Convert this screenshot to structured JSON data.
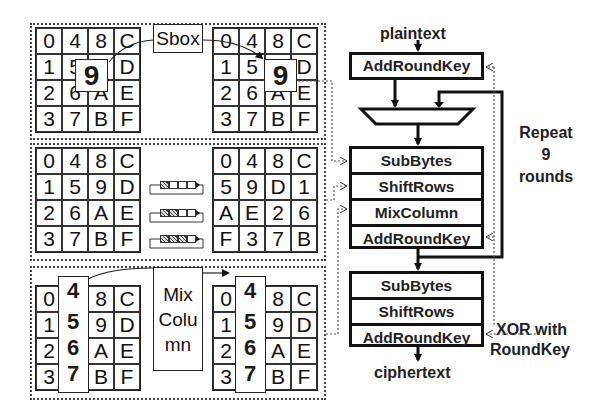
{
  "state_grid": [
    [
      "0",
      "4",
      "8",
      "C"
    ],
    [
      "1",
      "5",
      "9",
      "D"
    ],
    [
      "2",
      "6",
      "A",
      "E"
    ],
    [
      "3",
      "7",
      "B",
      "F"
    ]
  ],
  "subbytes_panel": {
    "before": [
      [
        "0",
        "4",
        "8",
        "C"
      ],
      [
        "1",
        "5",
        "9",
        "D"
      ],
      [
        "2",
        "6",
        "A",
        "E"
      ],
      [
        "3",
        "7",
        "B",
        "F"
      ]
    ],
    "after": [
      [
        "0",
        "4",
        "8",
        "C"
      ],
      [
        "1",
        "5",
        "9",
        "D"
      ],
      [
        "2",
        "6",
        "A",
        "E"
      ],
      [
        "3",
        "7",
        "B",
        "F"
      ]
    ],
    "highlight_byte": "9",
    "operation_label": "Sbox"
  },
  "shiftrows_panel": {
    "before": [
      [
        "0",
        "4",
        "8",
        "C"
      ],
      [
        "1",
        "5",
        "9",
        "D"
      ],
      [
        "2",
        "6",
        "A",
        "E"
      ],
      [
        "3",
        "7",
        "B",
        "F"
      ]
    ],
    "after": [
      [
        "0",
        "4",
        "8",
        "C"
      ],
      [
        "5",
        "9",
        "D",
        "1"
      ],
      [
        "A",
        "E",
        "2",
        "6"
      ],
      [
        "F",
        "3",
        "7",
        "B"
      ]
    ],
    "shift_amounts": [
      1,
      2,
      3
    ]
  },
  "mixcolumn_panel": {
    "before": [
      [
        "0",
        "4",
        "8",
        "C"
      ],
      [
        "1",
        "5",
        "9",
        "D"
      ],
      [
        "2",
        "6",
        "A",
        "E"
      ],
      [
        "3",
        "7",
        "B",
        "F"
      ]
    ],
    "after": [
      [
        "0",
        "4",
        "8",
        "C"
      ],
      [
        "1",
        "5",
        "9",
        "D"
      ],
      [
        "2",
        "6",
        "A",
        "E"
      ],
      [
        "3",
        "7",
        "B",
        "F"
      ]
    ],
    "highlight_column": [
      "4",
      "5",
      "6",
      "7"
    ],
    "operation_label_lines": [
      "Mix",
      "Colu",
      "mn"
    ]
  },
  "flowchart": {
    "input_label": "plaintext",
    "initial_step": "AddRoundKey",
    "round_steps": [
      "SubBytes",
      "ShiftRows",
      "MixColumn",
      "AddRoundKey"
    ],
    "repeat_label_lines": [
      "Repeat",
      "9",
      "rounds"
    ],
    "final_steps": [
      "SubBytes",
      "ShiftRows",
      "AddRoundKey"
    ],
    "key_label_lines": [
      "XOR with",
      "RoundKey"
    ],
    "output_label": "ciphertext"
  }
}
